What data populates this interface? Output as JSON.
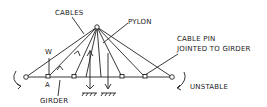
{
  "labels": {
    "cables": "CABLES",
    "pylon": "PYLON",
    "w": "W",
    "a": "A",
    "girder": "GIRDER",
    "cable_pin_1": "CABLE PIN",
    "cable_pin_2": "JOINTED TO GIRDER",
    "unstable": "UNSTABLE"
  },
  "colors": {
    "line": "#222222",
    "background": "#ffffff"
  }
}
